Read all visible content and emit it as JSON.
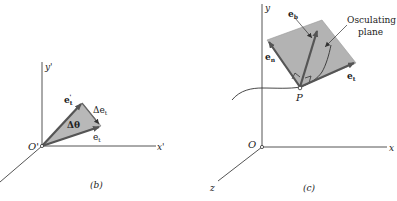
{
  "panel_b": {
    "caption": "(b)",
    "origin_label": "O'",
    "y_axis_label": "y'",
    "x_axis_label": "x'",
    "vector_et_prime_label": "e",
    "vector_et_prime_sub": "t",
    "vector_et_prime_sup": "'",
    "vector_et_label": "e",
    "vector_et_sub": "t",
    "delta_et_label": "Δe",
    "delta_et_sub": "t",
    "delta_theta_label": "Δθ"
  },
  "panel_c": {
    "caption": "(c)",
    "origin_label": "O",
    "y_axis_label": "y",
    "x_axis_label": "x",
    "z_axis_label": "z",
    "point_label": "P",
    "eb_label": "e",
    "eb_sub": "b",
    "en_label": "e",
    "en_sub": "n",
    "et_label": "e",
    "et_sub": "t",
    "plane_label_line1": "Osculating",
    "plane_label_line2": "plane"
  },
  "colors": {
    "axis": "#444444",
    "vector": "#555555",
    "shade": "#b8b8b8",
    "plane": "#b3b3b3"
  }
}
